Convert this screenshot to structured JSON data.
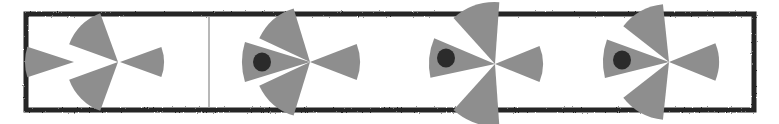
{
  "figure": {
    "canvas": {
      "width": 779,
      "height": 124
    },
    "background_color": "#ffffff"
  },
  "colors": {
    "wedge_fill": "#8e8e8e",
    "wedge_fill_dark": "#868686",
    "eye_fill": "#2b2b2b",
    "border_stroke": "#262626",
    "divider_stroke": "#9a9a9a",
    "paper": "#ffffff"
  },
  "frame": {
    "name": "outer-border",
    "x": 26,
    "y": 14,
    "width": 728,
    "height": 96,
    "stroke_width": 5,
    "style": "hand-drawn rough black rectangle"
  },
  "divider": {
    "name": "panel-divider",
    "x": 209,
    "y_top": 16,
    "y_bottom": 108,
    "stroke_width": 1.4
  },
  "panels": [
    {
      "id": "panel-1",
      "label": "disassembled-wedges",
      "caption": "",
      "piece_count": 4,
      "has_eye": false
    },
    {
      "id": "panel-2",
      "label": "fish-assembled-a",
      "caption": "",
      "piece_count": 4,
      "has_eye": true
    },
    {
      "id": "panel-3",
      "label": "fish-assembled-b",
      "caption": "",
      "piece_count": 4,
      "has_eye": true
    },
    {
      "id": "panel-4",
      "label": "fish-assembled-c",
      "caption": "",
      "piece_count": 4,
      "has_eye": true
    }
  ],
  "shapes": {
    "panel1": {
      "wedges": [
        {
          "name": "wedge-head-loose",
          "cx": 122,
          "cy": 62,
          "r": 49,
          "a0": 162,
          "a1": 198
        },
        {
          "name": "wedge-dorsal-loose",
          "cx": 118,
          "cy": 64,
          "r": 52,
          "a0": 200,
          "a1": 250
        },
        {
          "name": "wedge-tail-loose",
          "cx": 120,
          "cy": 62,
          "r": 44,
          "a0": -20,
          "a1": 20
        },
        {
          "name": "wedge-ventral-loose",
          "cx": 118,
          "cy": 60,
          "r": 52,
          "a0": 110,
          "a1": 160
        }
      ],
      "offsets": [
        {
          "dx": -48,
          "dy": 0
        },
        {
          "dx": 0,
          "dy": -2
        },
        {
          "dx": 0,
          "dy": 0
        },
        {
          "dx": 0,
          "dy": 2
        }
      ]
    },
    "panel2": {
      "origin": {
        "x": 310,
        "y": 62
      },
      "eye": {
        "cx": 262,
        "cy": 62,
        "rx": 9,
        "ry": 9.5
      },
      "wedges": [
        {
          "name": "wedge-head",
          "r": 68,
          "a0": 163,
          "a1": 197
        },
        {
          "name": "wedge-dorsal",
          "r": 56,
          "a0": 205,
          "a1": 253
        },
        {
          "name": "wedge-ventral",
          "r": 56,
          "a0": 107,
          "a1": 155
        },
        {
          "name": "wedge-tail",
          "r": 50,
          "a0": -21,
          "a1": 21
        }
      ]
    },
    "panel3": {
      "origin": {
        "x": 495,
        "y": 64
      },
      "eye": {
        "cx": 446,
        "cy": 58,
        "rx": 9,
        "ry": 9.5
      },
      "wedges": [
        {
          "name": "wedge-head",
          "r": 66,
          "a0": 168,
          "a1": 203
        },
        {
          "name": "wedge-dorsal",
          "r": 62,
          "a0": 228,
          "a1": 274
        },
        {
          "name": "wedge-ventral",
          "r": 62,
          "a0": 86,
          "a1": 132
        },
        {
          "name": "wedge-tail",
          "r": 48,
          "a0": -22,
          "a1": 22
        }
      ]
    },
    "panel4": {
      "origin": {
        "x": 669,
        "y": 62
      },
      "eye": {
        "cx": 622,
        "cy": 60,
        "rx": 9,
        "ry": 9.5
      },
      "wedges": [
        {
          "name": "wedge-head",
          "r": 66,
          "a0": 166,
          "a1": 200
        },
        {
          "name": "wedge-dorsal",
          "r": 58,
          "a0": 218,
          "a1": 264
        },
        {
          "name": "wedge-ventral",
          "r": 58,
          "a0": 96,
          "a1": 142
        },
        {
          "name": "wedge-tail",
          "r": 50,
          "a0": -22,
          "a1": 22
        }
      ]
    }
  }
}
